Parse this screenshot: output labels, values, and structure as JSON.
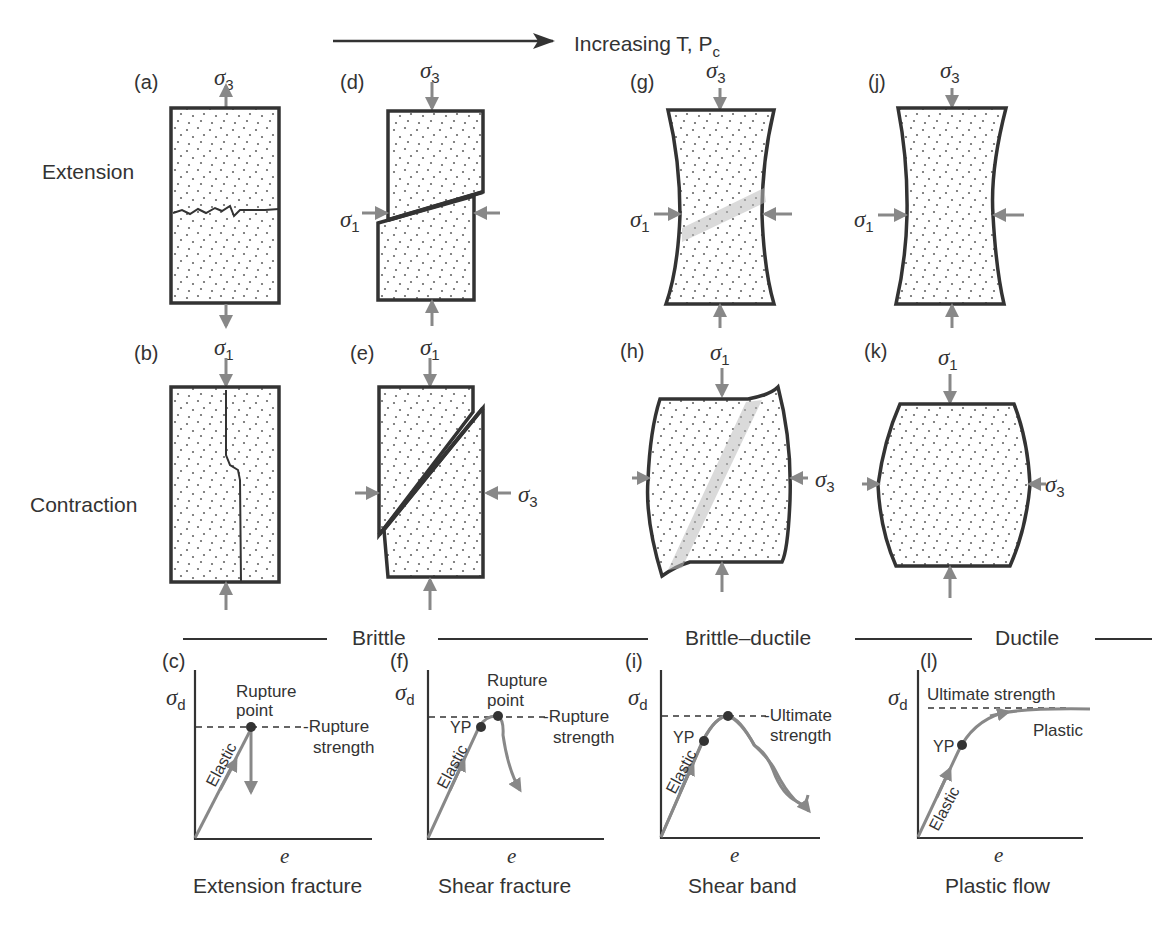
{
  "header": {
    "trend_label": "Increasing T, P",
    "trend_subscript": "c"
  },
  "rows": {
    "extension": "Extension",
    "contraction": "Contraction"
  },
  "panels": {
    "a": "(a)",
    "b": "(b)",
    "c": "(c)",
    "d": "(d)",
    "e": "(e)",
    "f": "(f)",
    "g": "(g)",
    "h": "(h)",
    "i": "(i)",
    "j": "(j)",
    "k": "(k)",
    "l": "(l)"
  },
  "stress": {
    "sigma": "σ",
    "one": "1",
    "three": "3",
    "d": "d"
  },
  "regimes": {
    "brittle": "Brittle",
    "brittle_ductile": "Brittle–ductile",
    "ductile": "Ductile"
  },
  "graphs": {
    "x_axis": "e",
    "elastic": "Elastic",
    "yp": "YP",
    "plastic": "Plastic",
    "rupture_point_1": "Rupture",
    "rupture_point_2": "point",
    "rupture_strength_1": "-Rupture",
    "rupture_strength_2": "strength",
    "ultimate_strength_1": "-Ultimate",
    "ultimate_strength_2": "strength",
    "ultimate_strength": "Ultimate strength"
  },
  "captions": {
    "c": "Extension fracture",
    "f": "Shear fracture",
    "i": "Shear band",
    "l": "Plastic flow"
  },
  "colors": {
    "outline": "#333333",
    "arrow": "#888888",
    "curve": "#8a8a8a",
    "stipple": "#6a6a6a",
    "band": "#c8c8c8"
  }
}
